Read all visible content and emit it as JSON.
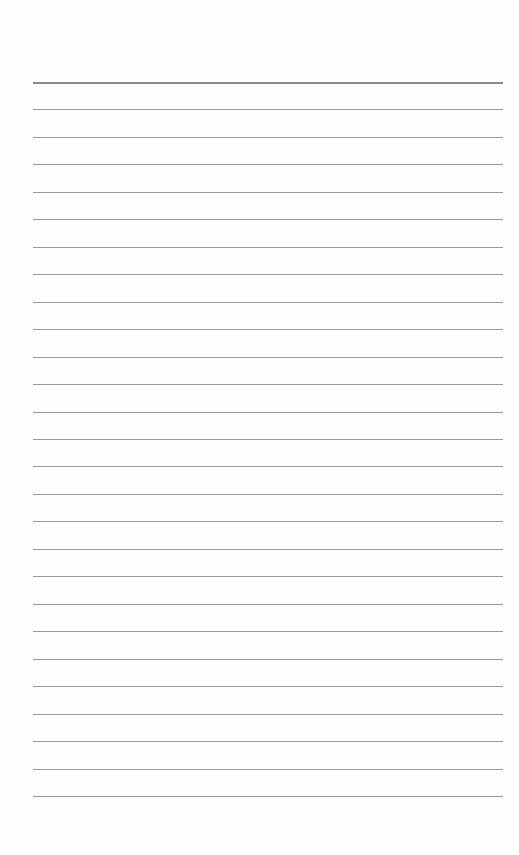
{
  "page": {
    "type": "lined-paper",
    "background_color": "#fefefe",
    "line_color": "#9a9a9a",
    "top_line_color": "#8c8c8c",
    "line_count": 27,
    "first_line_y": 82,
    "line_spacing": 27.46,
    "line_left": 33,
    "line_width": 470
  }
}
